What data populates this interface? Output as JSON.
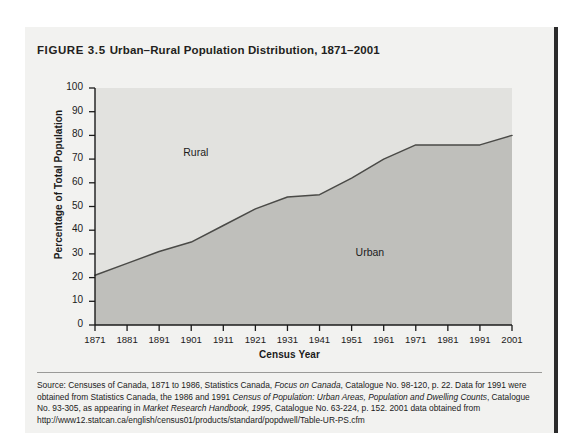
{
  "figure": {
    "number_label": "FIGURE 3.5",
    "title": "Urban–Rural Population Distribution, 1871–2001"
  },
  "labels": {
    "rural": "Rural",
    "urban": "Urban"
  },
  "source": {
    "line1_prefix": "Source: Censuses of Canada, 1871 to 1986, Statistics Canada, ",
    "italic1": "Focus on Canada",
    "line1_suffix": ", Catalogue No. 98-120, p. 22. Data for 1991 were obtained from Statistics Canada, the 1986 and 1991 ",
    "italic2": "Census of Population: Urban Areas, Population and Dwelling Counts",
    "line2_suffix": ", Catalogue No. 93-305, as appearing in ",
    "italic3": "Market Research Handbook, 1995",
    "line3_suffix": ", Catalogue No. 63-224, p. 152. 2001 data obtained from http://www12.statcan.ca/english/census01/products/standard/popdwell/Table-UR-PS.cfm"
  },
  "colors": {
    "card_background": "#f2f2f0",
    "rural_fill": "#e2e2df",
    "urban_fill": "#bfbfbb",
    "line": "#4a4a47",
    "axis": "#1b1b1b",
    "text": "#1b1b1b"
  },
  "chart_data": {
    "type": "area",
    "title": "Urban–Rural Population Distribution, 1871–2001",
    "xlabel": "Census Year",
    "ylabel": "Percentage of Total Population",
    "xlim": [
      1871,
      2001
    ],
    "ylim": [
      0,
      100
    ],
    "grid": false,
    "legend": "inline-area-labels",
    "x": [
      1871,
      1881,
      1891,
      1901,
      1911,
      1921,
      1931,
      1941,
      1951,
      1961,
      1971,
      1981,
      1991,
      2001
    ],
    "xtick_labels": [
      "1871",
      "1881",
      "1891",
      "1901",
      "1911",
      "1921",
      "1931",
      "1941",
      "1951",
      "1961",
      "1971",
      "1981",
      "1991",
      "2001"
    ],
    "ytick_labels": [
      "0",
      "10",
      "20",
      "30",
      "40",
      "50",
      "60",
      "70",
      "80",
      "90",
      "100"
    ],
    "ytick_values": [
      0,
      10,
      20,
      30,
      40,
      50,
      60,
      70,
      80,
      90,
      100
    ],
    "series": [
      {
        "name": "Urban",
        "values": [
          21,
          26,
          31,
          35,
          42,
          49,
          54,
          55,
          62,
          70,
          76,
          76,
          76,
          80
        ]
      },
      {
        "name": "Rural",
        "values": [
          79,
          74,
          69,
          65,
          58,
          51,
          46,
          45,
          38,
          30,
          24,
          24,
          24,
          20
        ]
      }
    ]
  }
}
